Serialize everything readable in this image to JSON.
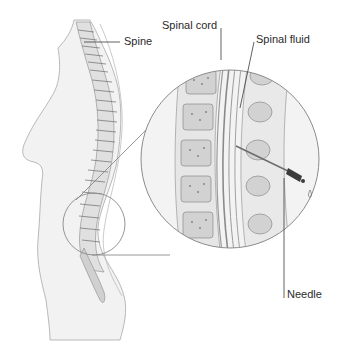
{
  "diagram": {
    "labels": {
      "spine": "Spine",
      "spinal_cord": "Spinal cord",
      "spinal_fluid": "Spinal fluid",
      "needle": "Needle"
    },
    "colors": {
      "skin_fill": "#f2f2f2",
      "outline": "#9a9a9a",
      "bone": "#d6d6d6",
      "bone_dark": "#8c8c8c",
      "leader_line": "#3a3a3a",
      "needle_hub": "#3c3c3c",
      "background": "#ffffff"
    }
  }
}
